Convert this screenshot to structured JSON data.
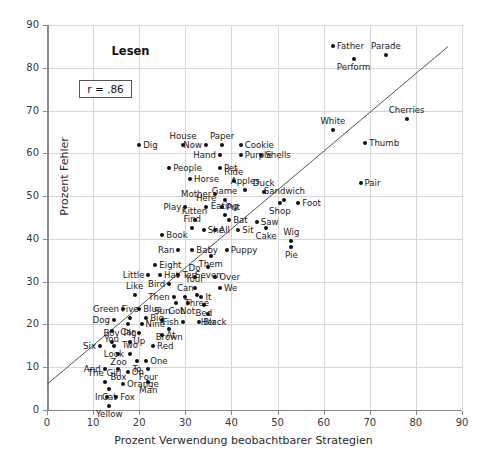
{
  "chart_data": {
    "type": "scatter",
    "title": "Lesen",
    "annotation": "r = .86",
    "xlabel": "Prozent Verwendung beobachtbarer Strategien",
    "ylabel": "Prozent Fehler",
    "xlim": [
      0,
      90
    ],
    "ylim": [
      0,
      90
    ],
    "xticks": [
      0,
      10,
      20,
      30,
      40,
      50,
      60,
      70,
      80,
      90
    ],
    "yticks": [
      0,
      10,
      20,
      30,
      40,
      50,
      60,
      70,
      80,
      90
    ],
    "grid": true,
    "legend": "none",
    "trendline": {
      "x0": 0,
      "y0": 6,
      "x1": 87,
      "y1": 85
    },
    "point_labels_visible": true,
    "points": [
      {
        "label": "Father",
        "x": 62.0,
        "y": 85.0,
        "pos": "r"
      },
      {
        "label": "Parade",
        "x": 73.5,
        "y": 83.0,
        "pos": "t"
      },
      {
        "label": "Perform",
        "x": 66.5,
        "y": 82.0,
        "pos": "b"
      },
      {
        "label": "Cherries",
        "x": 78.0,
        "y": 68.0,
        "pos": "t"
      },
      {
        "label": "White",
        "x": 62.0,
        "y": 65.5,
        "pos": "t"
      },
      {
        "label": "Thumb",
        "x": 69.0,
        "y": 62.5,
        "pos": "r"
      },
      {
        "label": "Dig",
        "x": 20.0,
        "y": 62.0,
        "pos": "r"
      },
      {
        "label": "House",
        "x": 29.5,
        "y": 62.0,
        "pos": "t"
      },
      {
        "label": "Now",
        "x": 34.5,
        "y": 62.0,
        "pos": "l"
      },
      {
        "label": "Paper",
        "x": 38.0,
        "y": 62.0,
        "pos": "t"
      },
      {
        "label": "Cookie",
        "x": 42.0,
        "y": 62.0,
        "pos": "r"
      },
      {
        "label": "Hand",
        "x": 37.5,
        "y": 59.5,
        "pos": "l"
      },
      {
        "label": "Purple",
        "x": 42.0,
        "y": 59.5,
        "pos": "r"
      },
      {
        "label": "Shells",
        "x": 46.5,
        "y": 59.5,
        "pos": "r"
      },
      {
        "label": "People",
        "x": 26.5,
        "y": 56.5,
        "pos": "r"
      },
      {
        "label": "Pet",
        "x": 37.5,
        "y": 56.5,
        "pos": "r"
      },
      {
        "label": "Pair",
        "x": 68.0,
        "y": 53.0,
        "pos": "r"
      },
      {
        "label": "Horse",
        "x": 31.0,
        "y": 54.0,
        "pos": "r"
      },
      {
        "label": "Ride",
        "x": 40.5,
        "y": 53.5,
        "pos": "t"
      },
      {
        "label": "Apples",
        "x": 43.0,
        "y": 51.5,
        "pos": "t"
      },
      {
        "label": "Mother",
        "x": 36.5,
        "y": 50.5,
        "pos": "l"
      },
      {
        "label": "Duck",
        "x": 47.0,
        "y": 51.0,
        "pos": "t"
      },
      {
        "label": "Sandwich",
        "x": 51.5,
        "y": 49.0,
        "pos": "t"
      },
      {
        "label": "Foot",
        "x": 54.5,
        "y": 48.5,
        "pos": "r"
      },
      {
        "label": "Shop",
        "x": 50.5,
        "y": 48.5,
        "pos": "b"
      },
      {
        "label": "Game",
        "x": 38.5,
        "y": 49.0,
        "pos": "t"
      },
      {
        "label": "Here",
        "x": 34.5,
        "y": 47.5,
        "pos": "t"
      },
      {
        "label": "Put",
        "x": 38.0,
        "y": 47.5,
        "pos": "r"
      },
      {
        "label": "Play",
        "x": 30.0,
        "y": 47.5,
        "pos": "l"
      },
      {
        "label": "Eating",
        "x": 38.5,
        "y": 45.5,
        "pos": "t"
      },
      {
        "label": "Bat",
        "x": 39.5,
        "y": 44.5,
        "pos": "r"
      },
      {
        "label": "Kitten",
        "x": 32.0,
        "y": 44.5,
        "pos": "t"
      },
      {
        "label": "Saw",
        "x": 45.5,
        "y": 44.0,
        "pos": "r"
      },
      {
        "label": "Cake",
        "x": 47.5,
        "y": 42.5,
        "pos": "b"
      },
      {
        "label": "Find",
        "x": 31.5,
        "y": 42.5,
        "pos": "t"
      },
      {
        "label": "She",
        "x": 34.0,
        "y": 42.0,
        "pos": "r"
      },
      {
        "label": "All",
        "x": 36.5,
        "y": 42.0,
        "pos": "r"
      },
      {
        "label": "Sit",
        "x": 41.5,
        "y": 42.0,
        "pos": "r"
      },
      {
        "label": "Book",
        "x": 25.0,
        "y": 41.0,
        "pos": "r"
      },
      {
        "label": "Wig",
        "x": 53.0,
        "y": 39.5,
        "pos": "t"
      },
      {
        "label": "Pie",
        "x": 53.0,
        "y": 38.0,
        "pos": "b"
      },
      {
        "label": "Ran",
        "x": 28.5,
        "y": 37.5,
        "pos": "l"
      },
      {
        "label": "Baby",
        "x": 31.5,
        "y": 37.5,
        "pos": "r"
      },
      {
        "label": "Puppy",
        "x": 39.0,
        "y": 37.5,
        "pos": "r"
      },
      {
        "label": "Them",
        "x": 35.5,
        "y": 36.0,
        "pos": "b"
      },
      {
        "label": "Eight",
        "x": 23.5,
        "y": 34.0,
        "pos": "r"
      },
      {
        "label": "Seven",
        "x": 35.0,
        "y": 33.5,
        "pos": "b"
      },
      {
        "label": "Little",
        "x": 22.0,
        "y": 31.5,
        "pos": "l"
      },
      {
        "label": "Hat",
        "x": 24.5,
        "y": 31.5,
        "pos": "r"
      },
      {
        "label": "Ten",
        "x": 28.5,
        "y": 31.5,
        "pos": "r"
      },
      {
        "label": "Do",
        "x": 32.0,
        "y": 31.0,
        "pos": "t"
      },
      {
        "label": "Over",
        "x": 36.5,
        "y": 31.0,
        "pos": "r"
      },
      {
        "label": "Bird",
        "x": 26.5,
        "y": 29.5,
        "pos": "l"
      },
      {
        "label": "Your",
        "x": 32.0,
        "y": 28.5,
        "pos": "t"
      },
      {
        "label": "We",
        "x": 37.5,
        "y": 28.5,
        "pos": "r"
      },
      {
        "label": "Three",
        "x": 32.5,
        "y": 27.0,
        "pos": "b"
      },
      {
        "label": "Like",
        "x": 19.0,
        "y": 27.0,
        "pos": "t"
      },
      {
        "label": "Then",
        "x": 27.5,
        "y": 26.5,
        "pos": "l"
      },
      {
        "label": "Can",
        "x": 30.0,
        "y": 26.5,
        "pos": "t"
      },
      {
        "label": "It",
        "x": 33.5,
        "y": 26.5,
        "pos": "r"
      },
      {
        "label": "Got",
        "x": 28.0,
        "y": 25.0,
        "pos": "b"
      },
      {
        "label": "Not",
        "x": 30.5,
        "y": 25.0,
        "pos": "b"
      },
      {
        "label": "Bed",
        "x": 34.0,
        "y": 24.5,
        "pos": "b"
      },
      {
        "label": "Green",
        "x": 16.5,
        "y": 23.5,
        "pos": "l"
      },
      {
        "label": "Blue",
        "x": 20.0,
        "y": 23.5,
        "pos": "r"
      },
      {
        "label": "Her",
        "x": 35.0,
        "y": 22.5,
        "pos": "b"
      },
      {
        "label": "Five",
        "x": 18.0,
        "y": 21.5,
        "pos": "t"
      },
      {
        "label": "Big",
        "x": 21.5,
        "y": 21.5,
        "pos": "r"
      },
      {
        "label": "Sun",
        "x": 25.0,
        "y": 21.0,
        "pos": "t"
      },
      {
        "label": "Fish",
        "x": 29.5,
        "y": 20.5,
        "pos": "l"
      },
      {
        "label": "Black",
        "x": 33.0,
        "y": 20.5,
        "pos": "r"
      },
      {
        "label": "Dog",
        "x": 14.5,
        "y": 21.0,
        "pos": "l"
      },
      {
        "label": "Car",
        "x": 17.5,
        "y": 20.0,
        "pos": "b"
      },
      {
        "label": "Nine",
        "x": 20.5,
        "y": 20.0,
        "pos": "r"
      },
      {
        "label": "You",
        "x": 14.0,
        "y": 18.5,
        "pos": "b"
      },
      {
        "label": "Brown",
        "x": 26.5,
        "y": 19.0,
        "pos": "b"
      },
      {
        "label": "Up",
        "x": 20.0,
        "y": 18.0,
        "pos": "b"
      },
      {
        "label": "At",
        "x": 25.0,
        "y": 17.5,
        "pos": "r"
      },
      {
        "label": "Six",
        "x": 11.5,
        "y": 15.0,
        "pos": "l"
      },
      {
        "label": "Boy",
        "x": 14.0,
        "y": 16.0,
        "pos": "t"
      },
      {
        "label": "Pig",
        "x": 18.0,
        "y": 16.0,
        "pos": "t"
      },
      {
        "label": "Look",
        "x": 14.5,
        "y": 15.0,
        "pos": "b"
      },
      {
        "label": "Red",
        "x": 23.0,
        "y": 15.0,
        "pos": "r"
      },
      {
        "label": "Zoo",
        "x": 15.5,
        "y": 13.0,
        "pos": "b"
      },
      {
        "label": "Two",
        "x": 18.0,
        "y": 13.0,
        "pos": "t"
      },
      {
        "label": "To",
        "x": 19.5,
        "y": 11.5,
        "pos": "b"
      },
      {
        "label": "One",
        "x": 21.5,
        "y": 11.5,
        "pos": "r"
      },
      {
        "label": "And",
        "x": 12.5,
        "y": 9.5,
        "pos": "l"
      },
      {
        "label": "Box",
        "x": 15.5,
        "y": 9.5,
        "pos": "b"
      },
      {
        "label": "On",
        "x": 17.5,
        "y": 9.0,
        "pos": "r"
      },
      {
        "label": "Four",
        "x": 22.0,
        "y": 9.5,
        "pos": "b"
      },
      {
        "label": "The Girl",
        "x": 12.5,
        "y": 6.5,
        "pos": "t"
      },
      {
        "label": "Man",
        "x": 22.0,
        "y": 6.5,
        "pos": "b"
      },
      {
        "label": "Orange",
        "x": 16.5,
        "y": 6.0,
        "pos": "r"
      },
      {
        "label": "Cat",
        "x": 13.5,
        "y": 5.0,
        "pos": "b"
      },
      {
        "label": "In",
        "x": 13.0,
        "y": 3.0,
        "pos": "l"
      },
      {
        "label": "Fox",
        "x": 15.0,
        "y": 3.0,
        "pos": "r"
      },
      {
        "label": "Yellow",
        "x": 13.5,
        "y": 1.0,
        "pos": "b"
      }
    ]
  }
}
